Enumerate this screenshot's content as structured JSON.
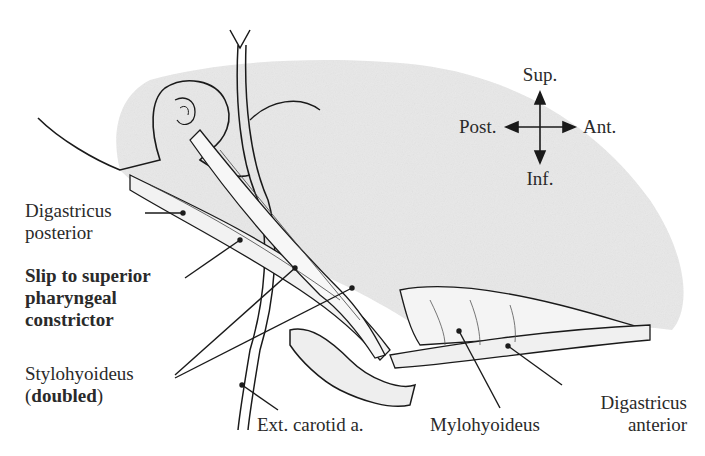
{
  "figure": {
    "compass": {
      "sup": "Sup.",
      "inf": "Inf.",
      "post": "Post.",
      "ant": "Ant."
    },
    "labels": {
      "digastricus_posterior_l1": "Digastricus",
      "digastricus_posterior_l2": "posterior",
      "slip_l1": "Slip to superior",
      "slip_l2": "pharyngeal",
      "slip_l3": "constrictor",
      "stylohyoideus_l1": "Stylohyoideus",
      "stylohyoideus_l2_open": "(",
      "stylohyoideus_l2_bold": "doubled",
      "stylohyoideus_l2_close": ")",
      "ext_carotid": "Ext. carotid a.",
      "mylohyoideus": "Mylohyoideus",
      "digastricus_anterior_l1": "Digastricus",
      "digastricus_anterior_l2": "anterior"
    },
    "colors": {
      "ink": "#1a1a1a",
      "shade": "#e6e6e6",
      "text": "#2a2a2a"
    }
  }
}
